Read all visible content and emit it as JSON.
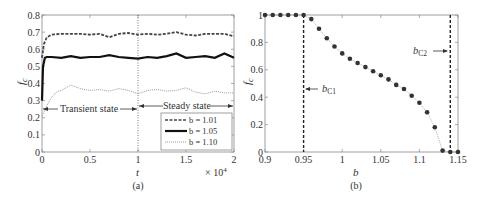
{
  "chart_data": [
    {
      "panel": "(a)",
      "type": "line",
      "title": "",
      "xlabel": "t",
      "ylabel": "f_c",
      "x_multiplier": "× 10^4",
      "xlim": [
        0,
        2
      ],
      "ylim": [
        0,
        0.8
      ],
      "xticks": [
        "0",
        "0.5",
        "1",
        "1.5",
        "2"
      ],
      "yticks": [
        "0",
        "0.1",
        "0.2",
        "0.3",
        "0.4",
        "0.5",
        "0.6",
        "0.7",
        "0.8"
      ],
      "grid": false,
      "legend_position": "lower right",
      "annotations": [
        {
          "text": "Transient state",
          "x_range": [
            0,
            1
          ],
          "y": 0.24
        },
        {
          "text": "Steady state",
          "x_range": [
            1,
            2
          ],
          "y": 0.24
        },
        {
          "text": "dotted vertical line",
          "x": 1
        }
      ],
      "series": [
        {
          "name": "b = 1.01",
          "style": "dashed",
          "x": [
            0,
            0.02,
            0.05,
            0.1,
            0.2,
            0.3,
            0.4,
            0.5,
            0.6,
            0.7,
            0.8,
            0.9,
            1.0,
            1.1,
            1.2,
            1.3,
            1.4,
            1.5,
            1.6,
            1.7,
            1.8,
            1.9,
            2.0
          ],
          "values": [
            0.55,
            0.63,
            0.67,
            0.685,
            0.69,
            0.69,
            0.69,
            0.685,
            0.69,
            0.67,
            0.69,
            0.695,
            0.685,
            0.69,
            0.685,
            0.69,
            0.7,
            0.685,
            0.68,
            0.69,
            0.69,
            0.69,
            0.675
          ]
        },
        {
          "name": "b = 1.05",
          "style": "solid",
          "x": [
            0,
            0.01,
            0.03,
            0.05,
            0.1,
            0.2,
            0.3,
            0.4,
            0.5,
            0.6,
            0.7,
            0.8,
            0.9,
            1.0,
            1.1,
            1.2,
            1.3,
            1.4,
            1.5,
            1.6,
            1.7,
            1.8,
            1.9,
            2.0
          ],
          "values": [
            0.3,
            0.5,
            0.55,
            0.555,
            0.555,
            0.55,
            0.56,
            0.55,
            0.555,
            0.555,
            0.565,
            0.555,
            0.55,
            0.545,
            0.555,
            0.55,
            0.56,
            0.575,
            0.55,
            0.555,
            0.56,
            0.55,
            0.575,
            0.55
          ]
        },
        {
          "name": "b = 1.10",
          "style": "dotted",
          "x": [
            0,
            0.05,
            0.1,
            0.15,
            0.2,
            0.3,
            0.4,
            0.5,
            0.6,
            0.7,
            0.8,
            0.9,
            1.0,
            1.1,
            1.2,
            1.3,
            1.4,
            1.5,
            1.6,
            1.7,
            1.8,
            1.9,
            2.0
          ],
          "values": [
            0.21,
            0.27,
            0.32,
            0.35,
            0.36,
            0.39,
            0.37,
            0.36,
            0.365,
            0.355,
            0.37,
            0.36,
            0.34,
            0.36,
            0.365,
            0.355,
            0.36,
            0.375,
            0.35,
            0.34,
            0.355,
            0.345,
            0.345
          ]
        }
      ]
    },
    {
      "panel": "(b)",
      "type": "scatter",
      "title": "",
      "xlabel": "b",
      "ylabel": "f_c",
      "xlim": [
        0.9,
        1.15
      ],
      "ylim": [
        0,
        1
      ],
      "xticks": [
        "0.9",
        "0.95",
        "1",
        "1.05",
        "1.1",
        "1.15"
      ],
      "yticks": [
        "0",
        "0.2",
        "0.4",
        "0.6",
        "0.8",
        "1"
      ],
      "grid": false,
      "annotations": [
        {
          "text": "b_C1",
          "x": 0.95,
          "style": "dashed vertical line",
          "arrow": "left-pointing to line"
        },
        {
          "text": "b_C2",
          "x": 1.14,
          "style": "dashed vertical line",
          "arrow": "right-pointing to line"
        }
      ],
      "series": [
        {
          "name": "f_c",
          "style": "dots with dotted line",
          "x": [
            0.9,
            0.91,
            0.92,
            0.93,
            0.94,
            0.95,
            0.96,
            0.97,
            0.98,
            0.99,
            1.0,
            1.01,
            1.02,
            1.03,
            1.04,
            1.05,
            1.06,
            1.07,
            1.08,
            1.09,
            1.1,
            1.11,
            1.12,
            1.13,
            1.14,
            1.15
          ],
          "values": [
            1.0,
            1.0,
            1.0,
            1.0,
            1.0,
            1.0,
            0.97,
            0.9,
            0.83,
            0.77,
            0.72,
            0.68,
            0.65,
            0.62,
            0.59,
            0.56,
            0.53,
            0.49,
            0.46,
            0.41,
            0.36,
            0.29,
            0.18,
            0.01,
            0.0,
            0.0
          ]
        }
      ]
    }
  ],
  "labels": {
    "a": {
      "ylabel": "f",
      "ylabel_sub": "c",
      "xlabel": "t",
      "multiplier": "× 10",
      "multiplier_exp": "4",
      "caption": "(a)",
      "transient": "Transient state",
      "steady": "Steady state",
      "legend": [
        "b = 1.01",
        "b = 1.05",
        "b = 1.10"
      ]
    },
    "b": {
      "ylabel": "f",
      "ylabel_sub": "c",
      "xlabel": "b",
      "caption": "(b)",
      "bc1": "b",
      "bc1_sub": "C1",
      "bc2": "b",
      "bc2_sub": "C2"
    }
  }
}
